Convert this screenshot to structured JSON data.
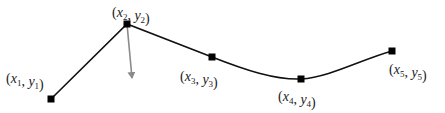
{
  "diagram": {
    "type": "polyline-curve",
    "colors": {
      "curve": "#111111",
      "arrow": "#8a8a8a",
      "point": "#000000",
      "label": "#222222"
    },
    "points": [
      {
        "id": "p1",
        "x": 51,
        "y": 99,
        "label": {
          "var_x": "x",
          "var_y": "y",
          "sub": "1",
          "lx": 6,
          "ly": 83
        }
      },
      {
        "id": "p2",
        "x": 127,
        "y": 24,
        "label": {
          "var_x": "x",
          "var_y": "y",
          "sub": "2",
          "lx": 112,
          "ly": 17
        }
      },
      {
        "id": "p3",
        "x": 212,
        "y": 57,
        "label": {
          "var_x": "x",
          "var_y": "y",
          "sub": "3",
          "lx": 180,
          "ly": 81
        }
      },
      {
        "id": "p4",
        "x": 301,
        "y": 79,
        "label": {
          "var_x": "x",
          "var_y": "y",
          "sub": "4",
          "lx": 278,
          "ly": 101
        }
      },
      {
        "id": "p5",
        "x": 392,
        "y": 51,
        "label": {
          "var_x": "x",
          "var_y": "y",
          "sub": "5",
          "lx": 389,
          "ly": 74
        }
      }
    ],
    "arrow": {
      "from": [
        127,
        24
      ],
      "to": [
        132,
        79
      ]
    }
  }
}
